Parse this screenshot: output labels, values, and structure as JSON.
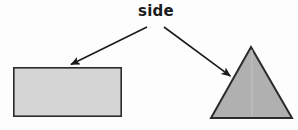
{
  "figure": {
    "type": "geometry-diagram",
    "background_color": "#fdfdfd",
    "label": {
      "text": "side",
      "x": 156,
      "y": 16,
      "font_size": 15,
      "font_weight": "bold",
      "color": "#1b1b1b"
    },
    "shapes": [
      {
        "name": "rectangle",
        "kind": "rect",
        "x": 13,
        "y": 67,
        "width": 109,
        "height": 50,
        "fill": "#d5d5d5",
        "stroke": "#2b2b2b",
        "stroke_width": 1.6
      },
      {
        "name": "triangle",
        "kind": "polygon",
        "points": "251,47 292,118 211,118",
        "fill": "#b0b0b0",
        "stroke": "#2b2b2b",
        "stroke_width": 2
      }
    ],
    "arrows": [
      {
        "name": "arrow-to-rectangle",
        "from_x": 147,
        "from_y": 27,
        "to_x": 68,
        "to_y": 66,
        "color": "#1b1b1b",
        "stroke_width": 1.6,
        "points_at": "rectangle"
      },
      {
        "name": "arrow-to-triangle",
        "from_x": 164,
        "from_y": 27,
        "to_x": 233,
        "to_y": 78,
        "color": "#1b1b1b",
        "stroke_width": 1.6,
        "points_at": "triangle"
      }
    ]
  }
}
